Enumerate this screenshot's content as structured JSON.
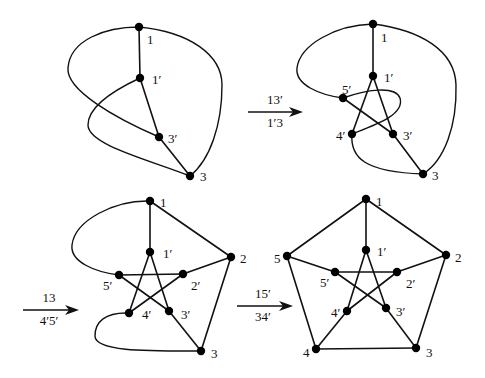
{
  "figure": {
    "panels": [
      {
        "id": "panel-1",
        "nodes": [
          {
            "id": "1",
            "label": "1",
            "x": 139,
            "y": 27,
            "lx": 147,
            "ly": 44
          },
          {
            "id": "1p",
            "label": "1′",
            "x": 140,
            "y": 78,
            "lx": 152,
            "ly": 84
          },
          {
            "id": "3p",
            "label": "3′",
            "x": 159,
            "y": 137,
            "lx": 168,
            "ly": 143
          },
          {
            "id": "3",
            "label": "3",
            "x": 190,
            "y": 176,
            "lx": 200,
            "ly": 181
          }
        ],
        "edges": [
          {
            "from": "1",
            "to": "1p"
          },
          {
            "from": "1p",
            "to": "3p"
          },
          {
            "from": "3p",
            "to": "3"
          }
        ],
        "curves": [
          {
            "name": "curve-1-to-3p",
            "d": "M139,27 C105,27 70,40 68,68 C66,90 115,118 159,137"
          },
          {
            "name": "curve-1p-to-3",
            "d": "M140,78 C110,92 88,108 88,125 C88,145 150,160 190,176"
          },
          {
            "name": "curve-1-to-3-right",
            "d": "M139,27 C190,32 222,55 222,85 C222,125 210,160 190,176"
          }
        ]
      },
      {
        "id": "panel-2",
        "nodes": [
          {
            "id": "1",
            "label": "1",
            "x": 373,
            "y": 24,
            "lx": 381,
            "ly": 42
          },
          {
            "id": "1p",
            "label": "1′",
            "x": 373,
            "y": 76,
            "lx": 384,
            "ly": 82
          },
          {
            "id": "5p",
            "label": "5′",
            "x": 343,
            "y": 98,
            "lx": 342,
            "ly": 94
          },
          {
            "id": "4p",
            "label": "4′",
            "x": 352,
            "y": 134,
            "lx": 336,
            "ly": 140
          },
          {
            "id": "3p",
            "label": "3′",
            "x": 393,
            "y": 134,
            "lx": 403,
            "ly": 140
          },
          {
            "id": "3",
            "label": "3",
            "x": 423,
            "y": 174,
            "lx": 432,
            "ly": 180
          }
        ],
        "edges": [
          {
            "from": "1",
            "to": "1p"
          },
          {
            "from": "1p",
            "to": "4p"
          },
          {
            "from": "1p",
            "to": "3p"
          },
          {
            "from": "5p",
            "to": "3p"
          },
          {
            "from": "3p",
            "to": "3"
          }
        ],
        "curves": [
          {
            "name": "curve-1-to-5p",
            "d": "M373,24 C335,25 300,45 297,68 C295,85 320,95 343,98"
          },
          {
            "name": "curve-5p-loop-to-4p",
            "d": "M343,98 C365,90 395,85 400,98 C405,115 375,125 352,134"
          },
          {
            "name": "curve-4p-to-3",
            "d": "M352,134 C350,158 365,172 423,174"
          },
          {
            "name": "curve-1-to-3-right",
            "d": "M373,24 C420,30 455,50 456,85 C457,125 445,160 423,174"
          }
        ]
      },
      {
        "id": "panel-3",
        "nodes": [
          {
            "id": "1",
            "label": "1",
            "x": 150,
            "y": 201,
            "lx": 160,
            "ly": 207
          },
          {
            "id": "1p",
            "label": "1′",
            "x": 150,
            "y": 252,
            "lx": 163,
            "ly": 258
          },
          {
            "id": "2",
            "label": "2",
            "x": 231,
            "y": 257,
            "lx": 240,
            "ly": 263
          },
          {
            "id": "5p",
            "label": "5′",
            "x": 119,
            "y": 275,
            "lx": 103,
            "ly": 290
          },
          {
            "id": "2p",
            "label": "2′",
            "x": 183,
            "y": 274,
            "lx": 191,
            "ly": 290
          },
          {
            "id": "4p",
            "label": "4′",
            "x": 129,
            "y": 313,
            "lx": 142,
            "ly": 319
          },
          {
            "id": "3p",
            "label": "3′",
            "x": 169,
            "y": 311,
            "lx": 181,
            "ly": 319
          },
          {
            "id": "3",
            "label": "3",
            "x": 201,
            "y": 351,
            "lx": 211,
            "ly": 358
          }
        ],
        "edges": [
          {
            "from": "1",
            "to": "1p"
          },
          {
            "from": "1",
            "to": "2"
          },
          {
            "from": "2",
            "to": "2p"
          },
          {
            "from": "2",
            "to": "3"
          },
          {
            "from": "1p",
            "to": "4p"
          },
          {
            "from": "1p",
            "to": "3p"
          },
          {
            "from": "5p",
            "to": "2p"
          },
          {
            "from": "5p",
            "to": "3p"
          },
          {
            "from": "2p",
            "to": "4p"
          },
          {
            "from": "3p",
            "to": "3"
          }
        ],
        "curves": [
          {
            "name": "curve-1-to-5p",
            "d": "M150,201 C115,200 75,220 72,245 C70,262 95,272 119,275"
          },
          {
            "name": "curve-4p-to-3",
            "d": "M129,313 C105,312 95,322 95,336 C95,352 150,351 201,351"
          }
        ]
      },
      {
        "id": "panel-4",
        "nodes": [
          {
            "id": "1",
            "label": "1",
            "x": 366,
            "y": 199,
            "lx": 376,
            "ly": 206
          },
          {
            "id": "1p",
            "label": "1′",
            "x": 366,
            "y": 250,
            "lx": 377,
            "ly": 256
          },
          {
            "id": "5",
            "label": "5",
            "x": 287,
            "y": 256,
            "lx": 274,
            "ly": 263
          },
          {
            "id": "2",
            "label": "2",
            "x": 446,
            "y": 255,
            "lx": 455,
            "ly": 262
          },
          {
            "id": "5p",
            "label": "5′",
            "x": 335,
            "y": 272,
            "lx": 320,
            "ly": 287
          },
          {
            "id": "2p",
            "label": "2′",
            "x": 397,
            "y": 272,
            "lx": 406,
            "ly": 288
          },
          {
            "id": "4p",
            "label": "4′",
            "x": 347,
            "y": 311,
            "lx": 331,
            "ly": 317
          },
          {
            "id": "3p",
            "label": "3′",
            "x": 386,
            "y": 308,
            "lx": 396,
            "ly": 316
          },
          {
            "id": "4",
            "label": "4",
            "x": 316,
            "y": 349,
            "lx": 303,
            "ly": 357
          },
          {
            "id": "3",
            "label": "3",
            "x": 416,
            "y": 348,
            "lx": 426,
            "ly": 357
          }
        ],
        "edges": [
          {
            "from": "1",
            "to": "1p"
          },
          {
            "from": "1",
            "to": "2"
          },
          {
            "from": "1",
            "to": "5"
          },
          {
            "from": "2",
            "to": "2p"
          },
          {
            "from": "2",
            "to": "3"
          },
          {
            "from": "5",
            "to": "5p"
          },
          {
            "from": "5",
            "to": "4"
          },
          {
            "from": "4",
            "to": "3"
          },
          {
            "from": "4",
            "to": "4p"
          },
          {
            "from": "1p",
            "to": "4p"
          },
          {
            "from": "1p",
            "to": "3p"
          },
          {
            "from": "5p",
            "to": "2p"
          },
          {
            "from": "5p",
            "to": "3p"
          },
          {
            "from": "2p",
            "to": "4p"
          },
          {
            "from": "3p",
            "to": "3"
          }
        ],
        "curves": []
      }
    ],
    "arrows": [
      {
        "name": "arrow-step-1",
        "x1": 248,
        "x2": 303,
        "y": 112,
        "top_label": "13′",
        "bottom_label": "1′3",
        "tx": 275,
        "ty_top": 104,
        "ty_bot": 127
      },
      {
        "name": "arrow-step-2",
        "x1": 23,
        "x2": 79,
        "y": 310,
        "top_label": "13",
        "bottom_label": "4′5′",
        "tx": 49,
        "ty_top": 302,
        "ty_bot": 325
      },
      {
        "name": "arrow-step-3",
        "x1": 237,
        "x2": 293,
        "y": 306,
        "top_label": "15′",
        "bottom_label": "34′",
        "tx": 263,
        "ty_top": 298,
        "ty_bot": 321
      }
    ]
  }
}
